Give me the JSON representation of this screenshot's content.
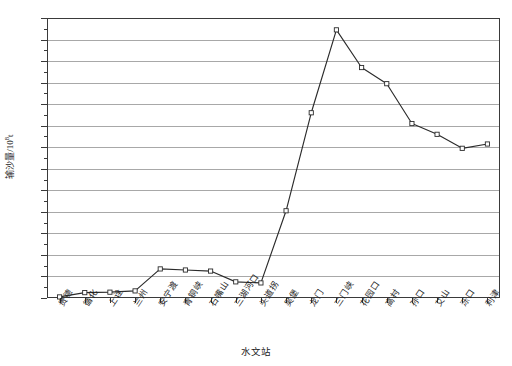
{
  "chart_data": {
    "type": "line",
    "title": "",
    "xlabel": "水文站",
    "ylabel": "输沙量/10⁸t",
    "ylabel_base": "输沙量/10",
    "ylabel_exp": "8",
    "ylabel_unit": "t",
    "grid": true,
    "legend": "none",
    "ylim": [
      0,
      13
    ],
    "yticks": [
      0,
      1,
      2,
      3,
      4,
      5,
      6,
      7,
      8,
      9,
      10,
      11,
      12,
      13
    ],
    "ytick_labels": [
      "0",
      "1",
      "2",
      "3",
      "4",
      "5",
      "6",
      "7",
      "8",
      "9",
      "10",
      "11",
      "12",
      "13"
    ],
    "categories": [
      "贵德",
      "循化",
      "上诠",
      "兰州",
      "安宁渡",
      "青铜峡",
      "石嘴山",
      "三湖河口",
      "头道拐",
      "吴堡",
      "龙门",
      "三门峡",
      "花园口",
      "高村",
      "孙口",
      "艾山",
      "泺口",
      "利津"
    ],
    "values": [
      0.05,
      0.25,
      0.27,
      0.33,
      1.35,
      1.3,
      1.25,
      0.75,
      0.7,
      4.05,
      8.6,
      12.45,
      10.7,
      9.95,
      8.1,
      7.6,
      6.95,
      7.15
    ],
    "marker": "open-square",
    "line_color": "#2b2b2b",
    "marker_fill": "#ffffff",
    "grid_color": "#a8a8a8",
    "axis_color": "#3a3a3a"
  }
}
